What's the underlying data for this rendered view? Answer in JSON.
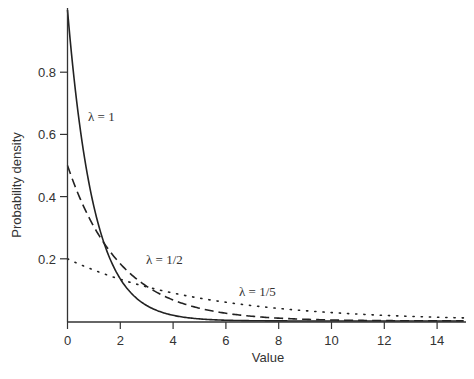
{
  "chart_data": {
    "type": "line",
    "title": "",
    "xlabel": "Value",
    "ylabel": "Probability density",
    "xlim": [
      0,
      15
    ],
    "ylim": [
      0,
      1.0
    ],
    "x_ticks": [
      0,
      2,
      4,
      6,
      8,
      10,
      12,
      14
    ],
    "x_tick_labels": [
      "0",
      "2",
      "4",
      "6",
      "8",
      "10",
      "12",
      "14"
    ],
    "y_ticks": [
      0.2,
      0.4,
      0.6,
      0.8
    ],
    "y_tick_labels": [
      "0.2",
      "0.4",
      "0.6",
      "0.8"
    ],
    "grid": false,
    "legend": "none (curves labelled inline)",
    "function": "lambda * exp(-lambda * x)",
    "series": [
      {
        "name": "λ = 1",
        "lambda": 1.0,
        "style": "solid",
        "x": [
          0,
          1,
          2,
          3,
          4,
          5,
          6,
          8,
          10,
          15
        ],
        "values": [
          1.0,
          0.368,
          0.135,
          0.05,
          0.018,
          0.007,
          0.002,
          0.0003,
          5e-05,
          0.0
        ]
      },
      {
        "name": "λ = 1/2",
        "lambda": 0.5,
        "style": "dashed",
        "x": [
          0,
          1,
          2,
          3,
          4,
          5,
          6,
          8,
          10,
          15
        ],
        "values": [
          0.5,
          0.303,
          0.184,
          0.112,
          0.068,
          0.041,
          0.025,
          0.009,
          0.003,
          0.0003
        ]
      },
      {
        "name": "λ = 1/5",
        "lambda": 0.2,
        "style": "dotted",
        "x": [
          0,
          1,
          2,
          3,
          4,
          5,
          6,
          8,
          10,
          15
        ],
        "values": [
          0.2,
          0.164,
          0.134,
          0.11,
          0.09,
          0.074,
          0.06,
          0.04,
          0.027,
          0.01
        ]
      }
    ],
    "annotations": [
      {
        "text": "λ = 1",
        "x": 1.3,
        "y": 0.62
      },
      {
        "text": "λ = 1/2",
        "x": 3.0,
        "y": 0.2
      },
      {
        "text": "λ = 1/5",
        "x": 6.2,
        "y": 0.12
      }
    ]
  }
}
